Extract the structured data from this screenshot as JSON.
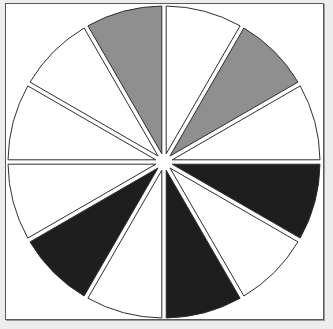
{
  "diagram": {
    "type": "segmented-wheel",
    "segment_count": 12,
    "segment_angle_deg": 30,
    "center": [
      164,
      162
    ],
    "radius": 156,
    "gap_px": 2.2,
    "stroke_color": "#2e2e2e",
    "start_angle_deg": -90,
    "direction": "clockwise",
    "colors": {
      "white": "#ffffff",
      "gray": "#8f8f8f",
      "black": "#1e1e1e"
    },
    "segments": [
      {
        "index": 0,
        "from_deg": -90,
        "to_deg": -60,
        "fill": "white"
      },
      {
        "index": 1,
        "from_deg": -60,
        "to_deg": -30,
        "fill": "gray"
      },
      {
        "index": 2,
        "from_deg": -30,
        "to_deg": 0,
        "fill": "white"
      },
      {
        "index": 3,
        "from_deg": 0,
        "to_deg": 30,
        "fill": "black"
      },
      {
        "index": 4,
        "from_deg": 30,
        "to_deg": 60,
        "fill": "white"
      },
      {
        "index": 5,
        "from_deg": 60,
        "to_deg": 90,
        "fill": "black"
      },
      {
        "index": 6,
        "from_deg": 90,
        "to_deg": 120,
        "fill": "white"
      },
      {
        "index": 7,
        "from_deg": 120,
        "to_deg": 150,
        "fill": "black"
      },
      {
        "index": 8,
        "from_deg": 150,
        "to_deg": 180,
        "fill": "white"
      },
      {
        "index": 9,
        "from_deg": 180,
        "to_deg": 210,
        "fill": "white"
      },
      {
        "index": 10,
        "from_deg": 210,
        "to_deg": 240,
        "fill": "white"
      },
      {
        "index": 11,
        "from_deg": 240,
        "to_deg": 270,
        "fill": "gray"
      }
    ]
  }
}
